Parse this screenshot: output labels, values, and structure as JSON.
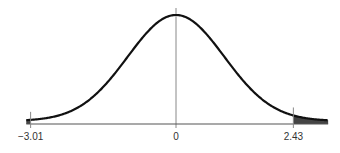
{
  "chart_data": {
    "type": "area",
    "title": "",
    "xlabel": "",
    "ylabel": "",
    "distribution": "standard normal",
    "xlim": [
      -3.1,
      3.15
    ],
    "mean": 0,
    "sd": 1,
    "shaded_regions": [
      {
        "from": -3.1,
        "to": -3.01,
        "side": "left tail"
      },
      {
        "from": 2.43,
        "to": 3.15,
        "side": "right tail"
      }
    ],
    "tick_labels": [
      {
        "value": -3.01,
        "label": "−3.01"
      },
      {
        "value": 0,
        "label": "0"
      },
      {
        "value": 2.43,
        "label": "2.43"
      }
    ],
    "colors": {
      "curve": "#111111",
      "shade": "#444444",
      "axis": "#555555",
      "center_line": "#888888"
    }
  }
}
